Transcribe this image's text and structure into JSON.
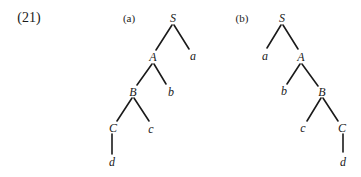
{
  "example_number": "(21)",
  "trees": [
    {
      "label": "(a)",
      "nodes": {
        "S": "S",
        "A": "A",
        "B": "B",
        "C": "C",
        "a": "a",
        "b": "b",
        "c": "c",
        "d": "d"
      },
      "edges": [
        [
          "S",
          "A"
        ],
        [
          "S",
          "a"
        ],
        [
          "A",
          "B"
        ],
        [
          "A",
          "b"
        ],
        [
          "B",
          "C"
        ],
        [
          "B",
          "c"
        ],
        [
          "C",
          "d"
        ]
      ]
    },
    {
      "label": "(b)",
      "nodes": {
        "S": "S",
        "A": "A",
        "B": "B",
        "C": "C",
        "a": "a",
        "b": "b",
        "c": "c",
        "d": "d"
      },
      "edges": [
        [
          "S",
          "a"
        ],
        [
          "S",
          "A"
        ],
        [
          "A",
          "b"
        ],
        [
          "A",
          "B"
        ],
        [
          "B",
          "c"
        ],
        [
          "B",
          "C"
        ],
        [
          "C",
          "d"
        ]
      ]
    }
  ],
  "colors": {
    "ink": "#1a1a1a",
    "background": "#ffffff"
  }
}
